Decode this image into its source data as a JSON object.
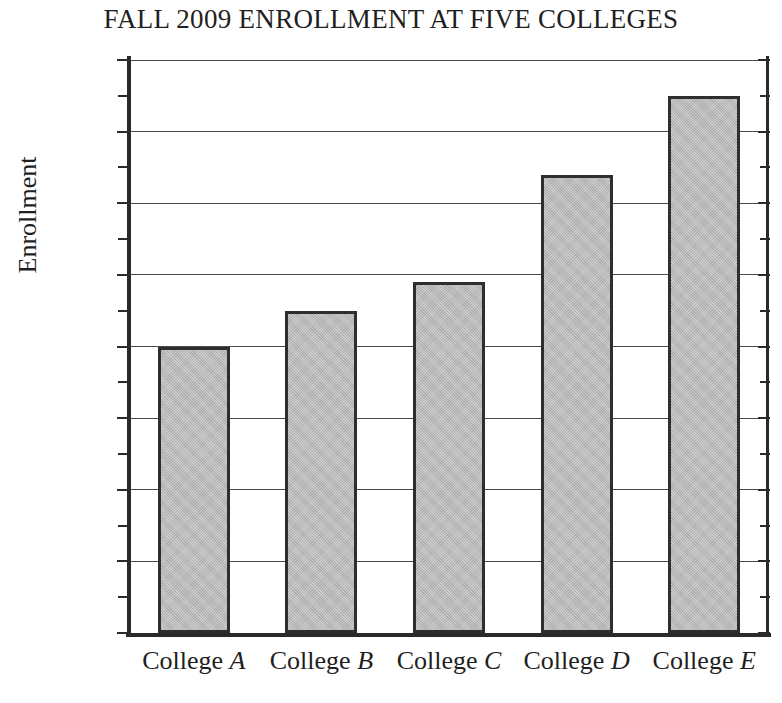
{
  "chart_data": {
    "type": "bar",
    "title": "FALL 2009 ENROLLMENT AT FIVE COLLEGES",
    "xlabel": "",
    "ylabel": "Enrollment",
    "categories": [
      "College A",
      "College B",
      "College C",
      "College D",
      "College E"
    ],
    "category_prefix": "College",
    "category_letters": [
      "A",
      "B",
      "C",
      "D",
      "E"
    ],
    "values": [
      4000,
      4500,
      4900,
      6400,
      7500
    ],
    "ylim": [
      0,
      8000
    ],
    "ytick_values": [
      0,
      1000,
      2000,
      3000,
      4000,
      5000,
      6000,
      7000,
      8000
    ],
    "ytick_labels": [
      "0",
      "1,000",
      "2,000",
      "3,000",
      "4,000",
      "5,000",
      "6,000",
      "7,000",
      "8,000"
    ],
    "yminor_tick_values": [
      500,
      1500,
      2500,
      3500,
      4500,
      5500,
      6500,
      7500
    ],
    "minor_tick_interval": 500,
    "grid": true,
    "grid_axis": "y",
    "legend": false,
    "legend_position": "none",
    "bar_fill_color": "#b9b9b9",
    "bar_edge_color": "#2e2e2e",
    "axis_color": "#2a2a2a",
    "gridline_color": "#4a4a4a",
    "background_color": "#ffffff"
  }
}
